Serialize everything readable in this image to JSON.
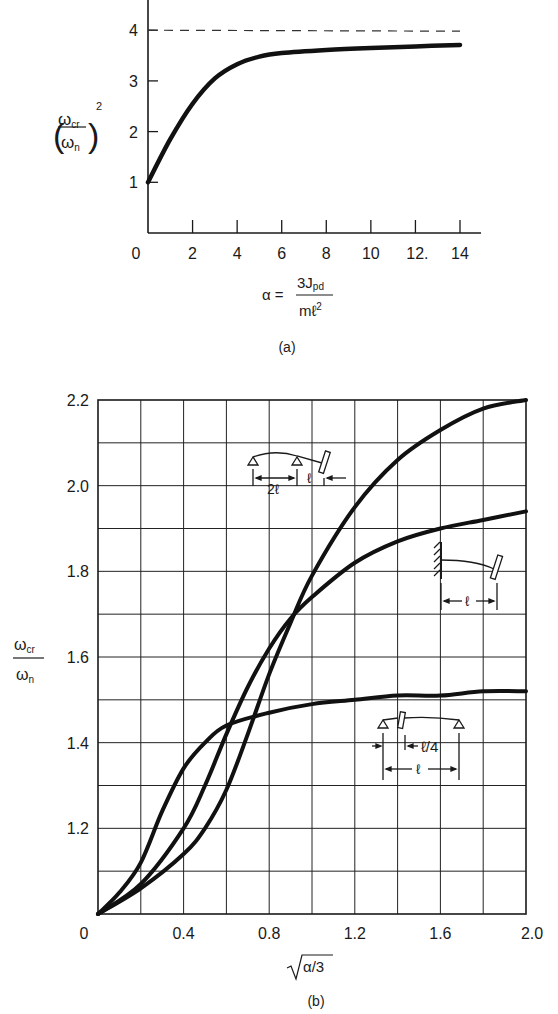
{
  "chart_data": [
    {
      "id": "a",
      "type": "line",
      "caption": "(a)",
      "title": "",
      "xlabel": "α = 3J_pd / mℓ²",
      "xlabel_parts": {
        "lhs": "α =",
        "num": "3J",
        "num_sub": "pd",
        "den": "mℓ",
        "den_sup": "2"
      },
      "ylabel": "(ω_cr / ω_n)²",
      "ylabel_parts": {
        "num": "ω",
        "num_sub": "cr",
        "den": "ω",
        "den_sub": "n",
        "sup": "2"
      },
      "xlim": [
        0,
        14
      ],
      "ylim": [
        0,
        4.5
      ],
      "x_ticks": [
        0,
        2,
        4,
        6,
        8,
        10,
        12,
        14
      ],
      "x_tick_labels": [
        "0",
        "2",
        "4",
        "6",
        "8",
        "10",
        "12.",
        "14"
      ],
      "y_ticks": [
        1,
        2,
        3,
        4
      ],
      "y_tick_labels": [
        "1",
        "2",
        "3",
        "4"
      ],
      "grid": false,
      "asymptote": {
        "y": 4,
        "style": "dashed"
      },
      "series": [
        {
          "name": "curve",
          "x": [
            0,
            1,
            2,
            3,
            4,
            5,
            6,
            8,
            10,
            12,
            14
          ],
          "y": [
            1.0,
            1.85,
            2.55,
            3.05,
            3.33,
            3.48,
            3.55,
            3.61,
            3.65,
            3.68,
            3.71
          ]
        }
      ]
    },
    {
      "id": "b",
      "type": "line",
      "caption": "(b)",
      "title": "",
      "xlabel": "√(α/3)",
      "ylabel": "ω_cr / ω_n",
      "ylabel_parts": {
        "num": "ω",
        "num_sub": "cr",
        "den": "ω",
        "den_sub": "n"
      },
      "xlim": [
        0,
        2.0
      ],
      "ylim": [
        1.0,
        2.2
      ],
      "x_ticks": [
        0,
        0.4,
        0.8,
        1.2,
        1.6,
        2.0
      ],
      "x_tick_labels": [
        "0",
        "0.4",
        "0.8",
        "1.2",
        "1.6",
        "2.0"
      ],
      "y_ticks": [
        1.2,
        1.4,
        1.6,
        1.8,
        2.0,
        2.2
      ],
      "y_tick_labels": [
        "1.2",
        "1.4",
        "1.6",
        "1.8",
        "2.0",
        "2.2"
      ],
      "grid": true,
      "grid_x_step": 0.2,
      "grid_y_step": 0.1,
      "series": [
        {
          "name": "two-span beam with overhang (2ℓ, ℓ)",
          "x": [
            0,
            0.2,
            0.4,
            0.5,
            0.6,
            0.7,
            0.8,
            0.9,
            1.0,
            1.2,
            1.4,
            1.6,
            1.8,
            2.0
          ],
          "y": [
            1.0,
            1.06,
            1.14,
            1.2,
            1.29,
            1.42,
            1.56,
            1.68,
            1.79,
            1.95,
            2.06,
            2.13,
            2.18,
            2.2
          ]
        },
        {
          "name": "cantilever (ℓ)",
          "x": [
            0,
            0.2,
            0.4,
            0.5,
            0.6,
            0.7,
            0.8,
            0.9,
            1.0,
            1.2,
            1.4,
            1.6,
            1.8,
            2.0
          ],
          "y": [
            1.0,
            1.07,
            1.2,
            1.3,
            1.42,
            1.53,
            1.62,
            1.69,
            1.74,
            1.82,
            1.87,
            1.9,
            1.92,
            1.94
          ]
        },
        {
          "name": "simply supported with disk at ℓ/4 (span ℓ)",
          "x": [
            0,
            0.1,
            0.2,
            0.3,
            0.4,
            0.5,
            0.6,
            0.8,
            1.0,
            1.2,
            1.4,
            1.6,
            1.8,
            2.0
          ],
          "y": [
            1.0,
            1.05,
            1.12,
            1.24,
            1.34,
            1.4,
            1.44,
            1.47,
            1.49,
            1.5,
            1.51,
            1.51,
            1.52,
            1.52
          ]
        }
      ],
      "annotations": [
        {
          "diagram": "two-span-overhang",
          "labels": [
            "2ℓ",
            "ℓ"
          ]
        },
        {
          "diagram": "cantilever",
          "labels": [
            "ℓ"
          ]
        },
        {
          "diagram": "simply-supported-quarter-disk",
          "labels": [
            "ℓ/4",
            "ℓ"
          ]
        }
      ]
    }
  ]
}
